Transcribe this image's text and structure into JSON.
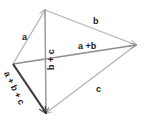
{
  "figure": {
    "type": "vector-addition-diagram",
    "background_color": "#ffffff",
    "stroke_light": "#b4b4b4",
    "stroke_mid": "#8c8c8c",
    "stroke_dark": "#3c3c3c",
    "text_color": "#1a1a1a"
  },
  "labels": {
    "a": "a",
    "b": "b",
    "c": "c",
    "a_plus_b": "a +b",
    "b_plus_c": "b + c",
    "a_plus_b_plus_c": "a + b + c"
  },
  "vertices": {
    "top": {
      "x": 45,
      "y": 10
    },
    "left": {
      "x": 13,
      "y": 64
    },
    "right": {
      "x": 136,
      "y": 45
    },
    "bottom": {
      "x": 46,
      "y": 113
    }
  },
  "vectors": [
    {
      "name": "a",
      "from": "left",
      "to": "top",
      "label": "a",
      "weight": "light"
    },
    {
      "name": "b",
      "from": "top",
      "to": "right",
      "label": "b",
      "weight": "light"
    },
    {
      "name": "c",
      "from": "right",
      "to": "bottom",
      "label": "c",
      "weight": "light"
    },
    {
      "name": "a-plus-b",
      "from": "left",
      "to": "right",
      "label": "a +b",
      "weight": "mid"
    },
    {
      "name": "b-plus-c",
      "from": "top",
      "to": "bottom",
      "label": "b + c",
      "weight": "mid"
    },
    {
      "name": "a-plus-b-plus-c",
      "from": "left",
      "to": "bottom",
      "label": "a + b + c",
      "weight": "dark"
    }
  ]
}
